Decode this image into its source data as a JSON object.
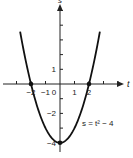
{
  "chart_data": {
    "type": "line",
    "title": "",
    "xlabel": "t",
    "ylabel": "s",
    "equation_label": "s = t² − 4",
    "function": "s = t^2 - 4",
    "x": [
      -2.7,
      -2.5,
      -2.25,
      -2,
      -1.75,
      -1.5,
      -1.25,
      -1,
      -0.75,
      -0.5,
      -0.25,
      0,
      0.25,
      0.5,
      0.75,
      1,
      1.25,
      1.5,
      1.75,
      2,
      2.25,
      2.5,
      2.7
    ],
    "series": [
      {
        "name": "s = t^2 - 4",
        "values": [
          3.29,
          2.25,
          1.0625,
          0,
          -0.9375,
          -1.75,
          -2.4375,
          -3,
          -3.4375,
          -3.75,
          -3.9375,
          -4,
          -3.9375,
          -3.75,
          -3.4375,
          -3,
          -2.4375,
          -1.75,
          -0.9375,
          0,
          1.0625,
          2.25,
          3.29
        ]
      }
    ],
    "points": [
      {
        "t": -2,
        "s": 0
      },
      {
        "t": 2,
        "s": 0
      },
      {
        "t": 0,
        "s": -4
      }
    ],
    "x_ticks": [
      -2,
      -1,
      0,
      1,
      2
    ],
    "x_tick_labels": [
      "−2",
      "−1",
      "0",
      "1",
      "2"
    ],
    "y_ticks": [
      1,
      -2,
      -4
    ],
    "y_tick_labels": [
      "1",
      "−2",
      "−4"
    ],
    "xlim": [
      -4.1,
      5
    ],
    "ylim": [
      -4.6,
      5.6
    ],
    "grid": false,
    "legend": "none"
  }
}
